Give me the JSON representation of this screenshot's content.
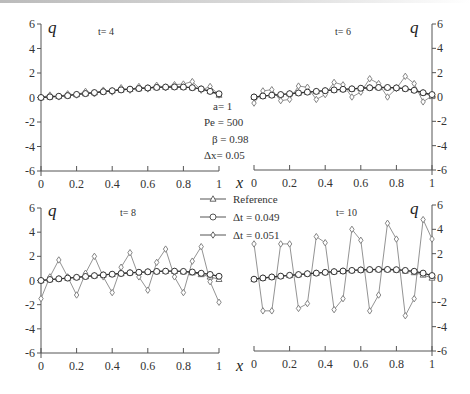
{
  "figure": {
    "parameters": [
      {
        "label": "a= 1"
      },
      {
        "label": "Pe = 500"
      },
      {
        "label": "β =  0.98"
      },
      {
        "label": "Δx= 0.05"
      }
    ],
    "legend": [
      {
        "label": "Reference",
        "marker": "triangle"
      },
      {
        "label": "Δt = 0.049",
        "marker": "circle"
      },
      {
        "label": "Δt = 0.051",
        "marker": "diamond"
      }
    ],
    "axis_q_label": "q",
    "axis_x_label": "x"
  },
  "chart_data": [
    {
      "type": "line",
      "title": "t= 4",
      "xlabel": "x",
      "ylabel": "q",
      "xlim": [
        0,
        1
      ],
      "ylim": [
        -6,
        6
      ],
      "xticks": [
        "0",
        "0.2",
        "0.4",
        "0.6",
        "0.8",
        "1"
      ],
      "yticks": [
        "6",
        "4",
        "2",
        "0",
        "-2",
        "-4",
        "-6"
      ],
      "x": [
        0,
        0.05,
        0.1,
        0.15,
        0.2,
        0.25,
        0.3,
        0.35,
        0.4,
        0.45,
        0.5,
        0.55,
        0.6,
        0.65,
        0.7,
        0.75,
        0.8,
        0.85,
        0.9,
        0.95,
        1
      ],
      "series": [
        {
          "name": "Reference",
          "values": [
            0,
            0.05,
            0.1,
            0.15,
            0.25,
            0.32,
            0.4,
            0.47,
            0.55,
            0.62,
            0.68,
            0.73,
            0.78,
            0.82,
            0.85,
            0.86,
            0.85,
            0.8,
            0.7,
            0.5,
            0.2
          ]
        },
        {
          "name": "Δt = 0.049",
          "values": [
            0,
            0.05,
            0.1,
            0.15,
            0.25,
            0.32,
            0.4,
            0.47,
            0.55,
            0.62,
            0.68,
            0.73,
            0.78,
            0.82,
            0.85,
            0.86,
            0.85,
            0.8,
            0.7,
            0.5,
            0.3
          ]
        },
        {
          "name": "Δt = 0.051",
          "values": [
            0,
            0.2,
            0.05,
            0.3,
            0.2,
            0.5,
            0.3,
            0.6,
            0.45,
            0.8,
            0.6,
            0.9,
            0.7,
            1.0,
            0.8,
            1.05,
            1.1,
            1.3,
            0.6,
            0.9,
            0.2
          ]
        }
      ]
    },
    {
      "type": "line",
      "title": "t= 6",
      "xlabel": "x",
      "ylabel": "q",
      "xlim": [
        0,
        1
      ],
      "ylim": [
        -6,
        6
      ],
      "xticks": [
        "0",
        "0.2",
        "0.4",
        "0.6",
        "0.8",
        "1"
      ],
      "yticks": [
        "6",
        "4",
        "2",
        "0",
        "-2",
        "-4",
        "-6"
      ],
      "x": [
        0,
        0.05,
        0.1,
        0.15,
        0.2,
        0.25,
        0.3,
        0.35,
        0.4,
        0.45,
        0.5,
        0.55,
        0.6,
        0.65,
        0.7,
        0.75,
        0.8,
        0.85,
        0.9,
        0.95,
        1
      ],
      "series": [
        {
          "name": "Reference",
          "values": [
            0,
            0.08,
            0.15,
            0.2,
            0.27,
            0.33,
            0.4,
            0.46,
            0.52,
            0.58,
            0.63,
            0.67,
            0.72,
            0.76,
            0.78,
            0.78,
            0.75,
            0.68,
            0.55,
            0.35,
            0.05
          ]
        },
        {
          "name": "Δt = 0.049",
          "values": [
            0,
            0.08,
            0.15,
            0.2,
            0.27,
            0.33,
            0.4,
            0.46,
            0.52,
            0.58,
            0.63,
            0.67,
            0.72,
            0.76,
            0.78,
            0.78,
            0.75,
            0.68,
            0.55,
            0.35,
            0.2
          ]
        },
        {
          "name": "Δt = 0.051",
          "values": [
            -0.5,
            0.5,
            0.6,
            -0.3,
            -0.2,
            0.9,
            0.8,
            -0.2,
            0.2,
            1.2,
            1.0,
            0.0,
            0.4,
            1.5,
            1.1,
            0.0,
            0.7,
            1.7,
            1.1,
            -0.4,
            0.1
          ]
        }
      ]
    },
    {
      "type": "line",
      "title": "t= 8",
      "xlabel": "x",
      "ylabel": "q",
      "xlim": [
        0,
        1
      ],
      "ylim": [
        -6,
        6
      ],
      "xticks": [
        "0",
        "0.2",
        "0.4",
        "0.6",
        "0.8",
        "1"
      ],
      "yticks": [
        "6",
        "4",
        "2",
        "0",
        "-2",
        "-4",
        "-6"
      ],
      "x": [
        0,
        0.05,
        0.1,
        0.15,
        0.2,
        0.25,
        0.3,
        0.35,
        0.4,
        0.45,
        0.5,
        0.55,
        0.6,
        0.65,
        0.7,
        0.75,
        0.8,
        0.85,
        0.9,
        0.95,
        1
      ],
      "series": [
        {
          "name": "Reference",
          "values": [
            0,
            0.08,
            0.14,
            0.2,
            0.26,
            0.33,
            0.4,
            0.46,
            0.52,
            0.58,
            0.64,
            0.68,
            0.72,
            0.75,
            0.77,
            0.77,
            0.73,
            0.65,
            0.5,
            0.3,
            0.1
          ]
        },
        {
          "name": "Δt = 0.049",
          "values": [
            0,
            0.08,
            0.14,
            0.2,
            0.26,
            0.33,
            0.4,
            0.46,
            0.52,
            0.58,
            0.64,
            0.68,
            0.72,
            0.75,
            0.77,
            0.77,
            0.75,
            0.7,
            0.6,
            0.5,
            0.35
          ]
        },
        {
          "name": "Δt = 0.051",
          "values": [
            -1.5,
            0.3,
            1.7,
            0.3,
            -1.2,
            0.6,
            2.0,
            0.3,
            -1.0,
            1.1,
            2.3,
            0.3,
            -0.8,
            1.5,
            2.6,
            0.3,
            -1.0,
            1.6,
            2.8,
            -0.1,
            -1.8
          ]
        }
      ]
    },
    {
      "type": "line",
      "title": "t= 10",
      "xlabel": "x",
      "ylabel": "q",
      "xlim": [
        0,
        1
      ],
      "ylim": [
        -6,
        6
      ],
      "xticks": [
        "0",
        "0.2",
        "0.4",
        "0.6",
        "0.8",
        "1"
      ],
      "yticks": [
        "6",
        "4",
        "2",
        "0",
        "-2",
        "-4",
        "-6"
      ],
      "x": [
        0,
        0.05,
        0.1,
        0.15,
        0.2,
        0.25,
        0.3,
        0.35,
        0.4,
        0.45,
        0.5,
        0.55,
        0.6,
        0.65,
        0.7,
        0.75,
        0.8,
        0.85,
        0.9,
        0.95,
        1
      ],
      "series": [
        {
          "name": "Reference",
          "values": [
            -0.1,
            0.0,
            0.08,
            0.15,
            0.22,
            0.28,
            0.35,
            0.4,
            0.46,
            0.52,
            0.57,
            0.62,
            0.66,
            0.69,
            0.7,
            0.7,
            0.66,
            0.58,
            0.45,
            0.25,
            0.0
          ]
        },
        {
          "name": "Δt = 0.049",
          "values": [
            -0.1,
            0.0,
            0.08,
            0.15,
            0.22,
            0.28,
            0.35,
            0.4,
            0.46,
            0.52,
            0.57,
            0.62,
            0.66,
            0.69,
            0.7,
            0.7,
            0.68,
            0.62,
            0.55,
            0.4,
            0.2
          ]
        },
        {
          "name": "Δt = 0.051",
          "values": [
            2.8,
            -2.7,
            -2.7,
            2.8,
            2.8,
            -2.5,
            -2.1,
            3.4,
            2.9,
            -2.6,
            -1.7,
            4.0,
            3.1,
            -2.7,
            -1.4,
            4.5,
            3.2,
            -3.1,
            -1.7,
            4.8,
            3.2
          ]
        }
      ]
    }
  ]
}
